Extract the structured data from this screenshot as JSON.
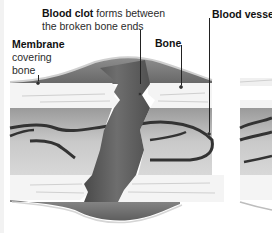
{
  "diagram": {
    "labels": {
      "blood_clot": {
        "title": "Blood clot",
        "description_line1": "forms between",
        "description_line2": "the broken bone ends"
      },
      "membrane": {
        "title": "Membrane",
        "description_line1": "covering",
        "description_line2": "bone"
      },
      "bone": {
        "title": "Bone"
      },
      "blood_vessel": {
        "title": "Blood vessel"
      }
    },
    "colors": {
      "bone": "#f4f4f4",
      "marrow": "#b8b8b8",
      "clot": "#5e5e5e",
      "vessel": "#3a3a3a",
      "membrane": "#8a8a8a",
      "background": "#ffffff"
    }
  }
}
